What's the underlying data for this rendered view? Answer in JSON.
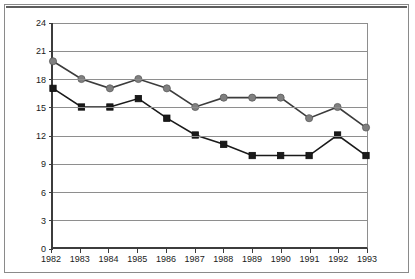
{
  "chart_data": {
    "type": "line",
    "title": "",
    "xlabel": "",
    "ylabel": "Years",
    "categories": [
      "1982",
      "1983",
      "1984",
      "1985",
      "1986",
      "1987",
      "1988",
      "1989",
      "1990",
      "1991",
      "1992",
      "1993"
    ],
    "yticks": [
      0,
      3,
      6,
      9,
      12,
      15,
      18,
      21,
      24
    ],
    "ylim": [
      0,
      24
    ],
    "grid": true,
    "legend": "none",
    "series": [
      {
        "name": "series-gray-circle",
        "marker": "circle",
        "color": "#808080",
        "line_color": "#3c3c3c",
        "values": [
          19.9,
          18.0,
          17.0,
          18.0,
          17.0,
          15.0,
          16.0,
          16.0,
          16.0,
          13.8,
          15.0,
          12.8
        ]
      },
      {
        "name": "series-black-square",
        "marker": "square",
        "color": "#1a1a1a",
        "line_color": "#1a1a1a",
        "values": [
          17.0,
          15.0,
          15.0,
          15.9,
          13.8,
          12.0,
          11.0,
          9.8,
          9.8,
          9.8,
          12.0,
          9.8
        ]
      }
    ]
  }
}
